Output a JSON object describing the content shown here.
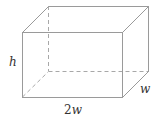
{
  "diagram": {
    "type": "rectangular-prism",
    "labels": {
      "height": "h",
      "length_coef": "2",
      "length_var": "w",
      "width": "w"
    },
    "colors": {
      "edge": "#9a9a9a",
      "label": "#333333",
      "background": "#ffffff"
    }
  }
}
